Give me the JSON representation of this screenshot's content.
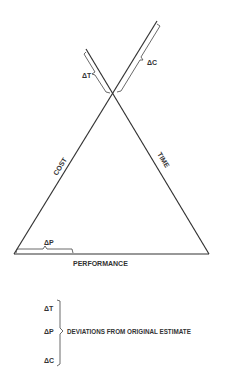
{
  "diagram": {
    "type": "project-triangle",
    "sides": {
      "left": "COST",
      "right": "TIME",
      "bottom": "PERFORMANCE"
    },
    "deviation_labels": {
      "time": "ΔT",
      "cost": "ΔC",
      "performance": "ΔP"
    },
    "legend": {
      "items": [
        "ΔT",
        "ΔP",
        "ΔC"
      ],
      "caption": "DEVIATIONS FROM ORIGINAL ESTIMATE"
    },
    "colors": {
      "line": "#333333",
      "background": "#ffffff"
    }
  }
}
